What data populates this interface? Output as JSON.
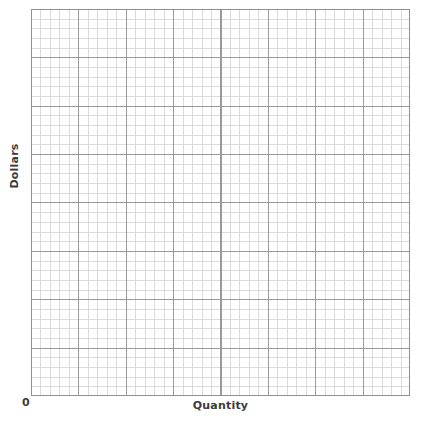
{
  "chart_data": {
    "type": "line",
    "title": "",
    "subtitle": "",
    "xlabel": "Quantity",
    "ylabel": "Dollars",
    "origin_label": "0",
    "series": [],
    "categories": [],
    "x": [],
    "annotations": [],
    "legend": {
      "entries": [],
      "position": "none"
    },
    "grid": {
      "visible": true,
      "style": "graph-paper",
      "major_divisions_x": 8,
      "major_divisions_y": 8,
      "minor_per_major": 5,
      "minor_cells_x": 40,
      "minor_cells_y": 40,
      "minor_color": "#dadada",
      "major_color": "#9a9a9a",
      "border_color": "#8f8f8f",
      "background_color": "#ffffff"
    },
    "axes": {
      "x_tick_labels": [],
      "y_tick_labels": [],
      "xlim": [
        0,
        40
      ],
      "ylim": [
        0,
        40
      ],
      "ticks_visible": false
    },
    "text_color": "#3b3b3b"
  },
  "figure": {
    "background_color": "#ffffff"
  }
}
